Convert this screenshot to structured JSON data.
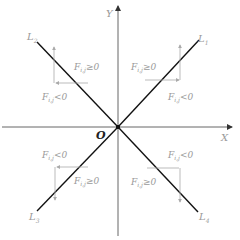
{
  "diagram": {
    "axes": {
      "x_label": "X",
      "y_label": "Y",
      "origin_label": "O"
    },
    "lines": [
      {
        "label": "L",
        "sub": "1",
        "quadrant": "I"
      },
      {
        "label": "L",
        "sub": "2",
        "quadrant": "II"
      },
      {
        "label": "L",
        "sub": "3",
        "quadrant": "III"
      },
      {
        "label": "L",
        "sub": "4",
        "quadrant": "IV"
      }
    ],
    "forces": {
      "q1": {
        "vertical": {
          "F": "F",
          "sub": "i,j",
          "cond": "≥0"
        },
        "horizontal": {
          "F": "F",
          "sub": "i,j",
          "cond": "<0"
        }
      },
      "q2": {
        "vertical": {
          "F": "F",
          "sub": "i,j",
          "cond": "≥0"
        },
        "horizontal": {
          "F": "F",
          "sub": "i,j",
          "cond": "<0"
        }
      },
      "q3": {
        "horizontal": {
          "F": "F",
          "sub": "i,j",
          "cond": "<0"
        },
        "vertical": {
          "F": "F",
          "sub": "i,j",
          "cond": "≥0"
        }
      },
      "q4": {
        "horizontal": {
          "F": "F",
          "sub": "i,j",
          "cond": "<0"
        },
        "vertical": {
          "F": "F",
          "sub": "i,j",
          "cond": "≥0"
        }
      }
    },
    "colors": {
      "axis": "#555555",
      "line": "#111111",
      "force": "#aaaaaa",
      "text": "#9a9a9a"
    }
  }
}
